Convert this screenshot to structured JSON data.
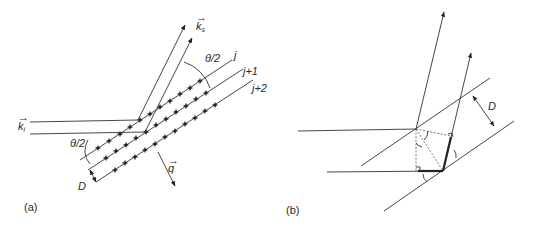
{
  "panel_a": {
    "label": "(a)",
    "incident_wave": "k",
    "incident_sub": "i",
    "scattered_wave": "k",
    "scattered_sub": "s",
    "scattering_vector": "q",
    "half_angle_top": "θ/2",
    "half_angle_left": "θ/2",
    "plane_labels": [
      "j",
      "j+1",
      "j+2"
    ],
    "spacing": "D"
  },
  "panel_b": {
    "label": "(b)",
    "spacing": "D"
  },
  "colors": {
    "ink": "#333333",
    "background": "#ffffff"
  }
}
